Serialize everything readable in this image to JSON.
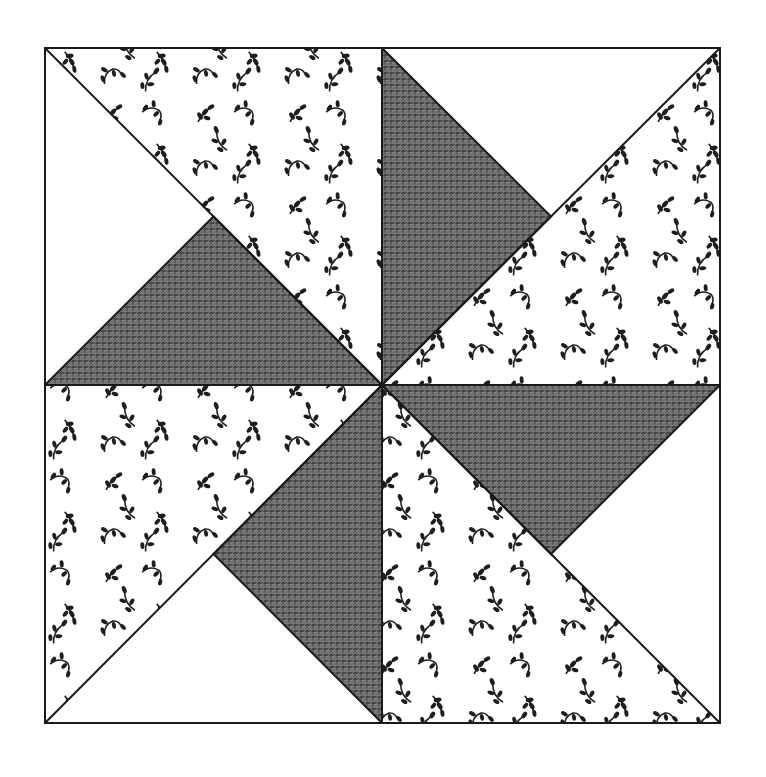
{
  "illustration": {
    "subject": "pinwheel quilt block",
    "description": "Hand-drawn pinwheel quilt block: a square divided into four quadrants, each with a floral-print half-square triangle and a dark cross-hatched triangle, arranged to rotate around the center.",
    "colors": {
      "background": "#ffffff",
      "outline": "#1a1a1a",
      "dark_fill": "#6e6e6e",
      "dark_hatch": "#2b2b2b",
      "floral_ink": "#1e1e1e",
      "plain_fill": "#ffffff"
    },
    "frame": {
      "left": 45,
      "top": 48,
      "right": 720,
      "bottom": 723
    },
    "center": {
      "x": 382,
      "y": 385
    },
    "quadrants": [
      {
        "name": "upper-left",
        "floral_triangle": [
          [
            45,
            48
          ],
          [
            382,
            48
          ],
          [
            382,
            385
          ]
        ],
        "dark_triangle": [
          [
            45,
            385
          ],
          [
            382,
            385
          ],
          [
            213.5,
            216.5
          ]
        ],
        "plain_regions": [
          [
            [
              45,
              48
            ],
            [
              213.5,
              216.5
            ],
            [
              45,
              385
            ]
          ]
        ]
      },
      {
        "name": "upper-right",
        "floral_triangle": [
          [
            720,
            48
          ],
          [
            720,
            385
          ],
          [
            382,
            385
          ]
        ],
        "dark_triangle": [
          [
            382,
            48
          ],
          [
            382,
            385
          ],
          [
            551,
            216.5
          ]
        ],
        "plain_regions": [
          [
            [
              382,
              48
            ],
            [
              720,
              48
            ],
            [
              551,
              216.5
            ]
          ]
        ]
      },
      {
        "name": "lower-right",
        "floral_triangle": [
          [
            382,
            385
          ],
          [
            382,
            723
          ],
          [
            720,
            723
          ]
        ],
        "dark_triangle": [
          [
            382,
            385
          ],
          [
            720,
            385
          ],
          [
            551,
            554
          ]
        ],
        "plain_regions": [
          [
            [
              720,
              385
            ],
            [
              720,
              723
            ],
            [
              551,
              554
            ]
          ]
        ]
      },
      {
        "name": "lower-left",
        "floral_triangle": [
          [
            45,
            385
          ],
          [
            382,
            385
          ],
          [
            45,
            723
          ]
        ],
        "dark_triangle": [
          [
            382,
            385
          ],
          [
            382,
            723
          ],
          [
            213.5,
            554
          ]
        ],
        "plain_regions": [
          [
            [
              45,
              723
            ],
            [
              382,
              723
            ],
            [
              213.5,
              554
            ]
          ]
        ]
      }
    ]
  }
}
